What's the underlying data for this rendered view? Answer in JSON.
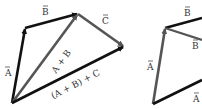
{
  "colors": {
    "black_vector": "#111111",
    "gray_vector": "#555555",
    "background": "#ffffff",
    "label": "#333333"
  },
  "left_figure": {
    "vectors": [
      {
        "id": "A",
        "from": [
          12,
          103
        ],
        "to": [
          25,
          28
        ],
        "color": "black"
      },
      {
        "id": "B",
        "from": [
          25,
          28
        ],
        "to": [
          78,
          14
        ],
        "color": "black"
      },
      {
        "id": "A+B",
        "from": [
          12,
          103
        ],
        "to": [
          78,
          14
        ],
        "color": "gray"
      },
      {
        "id": "C",
        "from": [
          78,
          14
        ],
        "to": [
          124,
          47
        ],
        "color": "gray"
      },
      {
        "id": "(A+B)+C",
        "from": [
          12,
          103
        ],
        "to": [
          124,
          47
        ],
        "color": "black"
      }
    ],
    "labels": {
      "A": "A",
      "B": "B",
      "C": "C",
      "A_plus_B": "A + B",
      "AB_plus_C": "(A + B) + C"
    }
  },
  "right_figure": {
    "vectors": [
      {
        "id": "A",
        "from": [
          153,
          104
        ],
        "to": [
          165,
          28
        ],
        "color": "gray"
      },
      {
        "id": "B",
        "from": [
          165,
          28
        ],
        "to": [
          202,
          18
        ],
        "color": "black"
      },
      {
        "id": "B'",
        "from": [
          165,
          28
        ],
        "to": [
          202,
          40
        ],
        "color": "gray"
      },
      {
        "id": "A+...",
        "from": [
          153,
          104
        ],
        "to": [
          202,
          80
        ],
        "color": "black"
      }
    ],
    "labels": {
      "A": "A",
      "B_top": "B",
      "B_lower": "B",
      "A_partial": "A"
    }
  }
}
